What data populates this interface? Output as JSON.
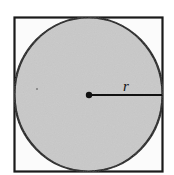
{
  "diagram": {
    "shapes": {
      "square": {
        "fill": "#fbfbfb",
        "stroke": "#1a1a1a"
      },
      "circle": {
        "fill": "#c9c9c9",
        "stroke": "#1a1a1a"
      },
      "radius_line": {
        "stroke": "#111111"
      },
      "center_point": {
        "fill": "#111111"
      }
    },
    "labels": {
      "radius": "r"
    }
  }
}
